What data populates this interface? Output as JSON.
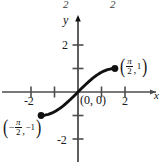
{
  "figure": {
    "width": 164,
    "height": 164,
    "background": "#ffffff",
    "curve_color": "#111111",
    "axis_color": "#4d4d4d"
  },
  "top_strip": {
    "note": "partially cropped characters from surrounding page above the figure",
    "left_fragment": "2",
    "right_fragment": "2"
  },
  "axes": {
    "x_label": "x",
    "y_label": "y",
    "x_ticks": [
      {
        "value": -2,
        "label": "-2",
        "show_label": true
      },
      {
        "value": -1,
        "label": "",
        "show_label": false
      },
      {
        "value": 1,
        "label": "",
        "show_label": false
      },
      {
        "value": 2,
        "label": "2",
        "show_label": true
      }
    ],
    "y_ticks": [
      {
        "value": 2,
        "label": "2",
        "show_label": true
      },
      {
        "value": 1,
        "label": "",
        "show_label": false
      },
      {
        "value": -1,
        "label": "",
        "show_label": false
      },
      {
        "value": -2,
        "label": "-2",
        "show_label": true
      }
    ],
    "xlim": [
      -3.3,
      3.6
    ],
    "ylim": [
      -3.2,
      3.4
    ],
    "origin_px": [
      78,
      92
    ],
    "unit_px": 23.5
  },
  "annotations": {
    "origin": {
      "text": "(0, 0)",
      "x": 0,
      "y": 0
    },
    "right_endpoint": {
      "paren_open": "(",
      "numerator": "π",
      "denominator": "2",
      "comma": ",",
      "second": "1",
      "paren_close": ")",
      "x_value": 1.5708,
      "y_value": 1
    },
    "left_endpoint": {
      "paren_open": "(",
      "minus": "−",
      "numerator": "π",
      "denominator": "2",
      "comma": ",",
      "second": "−1",
      "paren_close": ")",
      "x_value": -1.5708,
      "y_value": -1
    }
  },
  "chart_data": {
    "type": "line",
    "title": "",
    "subtitle": "",
    "xlabel": "x",
    "ylabel": "y",
    "xlim": [
      -3.3,
      3.6
    ],
    "ylim": [
      -3.2,
      3.4
    ],
    "xticks": [
      -2,
      -1,
      1,
      2
    ],
    "xticklabels": [
      "-2",
      "",
      "",
      "2"
    ],
    "yticks": [
      -2,
      -1,
      1,
      2
    ],
    "yticklabels": [
      "-2",
      "",
      "",
      "2"
    ],
    "grid": false,
    "legend": false,
    "series": [
      {
        "name": "y = sin(x) on [-π/2, π/2]",
        "style": "solid-thick",
        "color": "#111111",
        "x": [
          -1.5708,
          -1.4137,
          -1.2566,
          -1.0996,
          -0.9425,
          -0.7854,
          -0.6283,
          -0.4712,
          -0.3142,
          -0.1571,
          0.0,
          0.1571,
          0.3142,
          0.4712,
          0.6283,
          0.7854,
          0.9425,
          1.0996,
          1.2566,
          1.4137,
          1.5708
        ],
        "y": [
          -1.0,
          -0.9877,
          -0.9511,
          -0.891,
          -0.809,
          -0.7071,
          -0.5878,
          -0.454,
          -0.309,
          -0.1564,
          0.0,
          0.1564,
          0.309,
          0.454,
          0.5878,
          0.7071,
          0.809,
          0.891,
          0.9511,
          0.9877,
          1.0
        ]
      }
    ],
    "markers": [
      {
        "x": -1.5708,
        "y": -1,
        "filled": true,
        "label": "(-π/2, -1)"
      },
      {
        "x": 1.5708,
        "y": 1,
        "filled": true,
        "label": "(π/2, 1)"
      }
    ],
    "point_annotations": [
      {
        "x": 0,
        "y": 0,
        "text": "(0, 0)"
      }
    ],
    "annotations": [
      "(0, 0)",
      "(π/2, 1)",
      "(-π/2, -1)"
    ]
  }
}
